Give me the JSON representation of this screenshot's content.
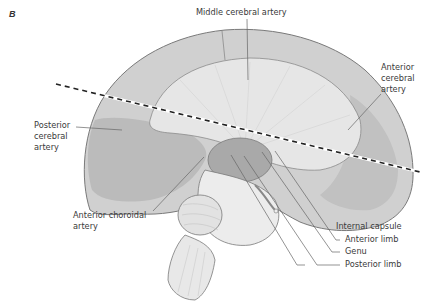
{
  "figure": {
    "panel_letter": "B",
    "labels": {
      "middle_cerebral_artery": "Middle cerebral artery",
      "anterior_cerebral_artery": "Anterior\ncerebral\nartery",
      "posterior_cerebral_artery": "Posterior\ncerebral\nartery",
      "anterior_choroidal_artery": "Anterior choroidal\nartery",
      "internal_capsule": "Internal capsule",
      "anterior_limb": "Anterior limb",
      "genu": "Genu",
      "posterior_limb": "Posterior limb"
    },
    "colors": {
      "cortex_fill": "#d2d2d2",
      "territory_fill": "#b9b9b9",
      "white_matter_fill": "#e4e4e4",
      "outline": "#7a7a7a",
      "leader_line": "#666666",
      "section_line": "#222222"
    }
  }
}
